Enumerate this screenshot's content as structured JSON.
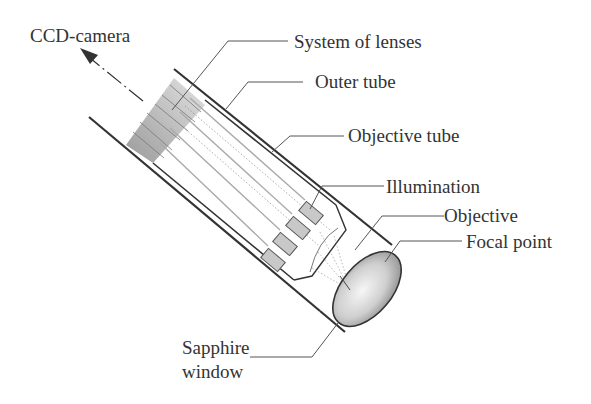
{
  "diagram": {
    "labels": {
      "ccd_camera": "CCD-camera",
      "system_of_lenses": "System of lenses",
      "outer_tube": "Outer tube",
      "objective_tube": "Objective tube",
      "illumination": "Illumination",
      "objective": "Objective",
      "focal_point": "Focal point",
      "sapphire_line1": "Sapphire",
      "sapphire_line2": "window"
    },
    "colors": {
      "line": "#333333",
      "leader": "#555555",
      "lens_gray": "#bdbdbd",
      "illum_fill": "#c8c8c8",
      "text": "#333333"
    }
  }
}
